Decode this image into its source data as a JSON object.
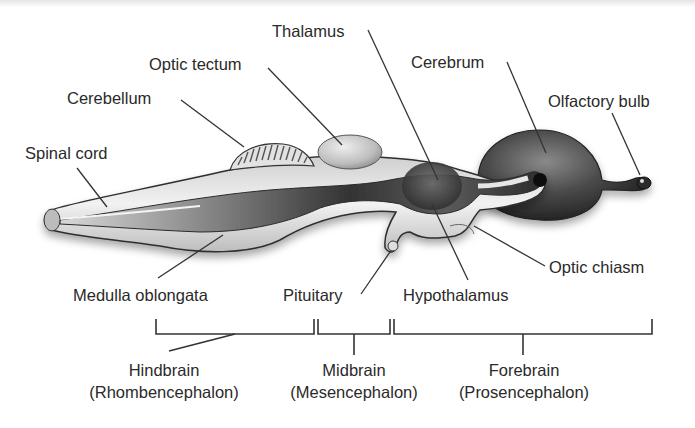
{
  "diagram": {
    "structure_labels": {
      "thalamus": "Thalamus",
      "optic_tectum": "Optic tectum",
      "cerebrum": "Cerebrum",
      "cerebellum": "Cerebellum",
      "olfactory_bulb": "Olfactory bulb",
      "spinal_cord": "Spinal cord",
      "optic_chiasm": "Optic chiasm",
      "medulla_oblongata": "Medulla oblongata",
      "pituitary": "Pituitary",
      "hypothalamus": "Hypothalamus"
    },
    "divisions": [
      {
        "name": "Hindbrain",
        "latin": "(Rhombencephalon)"
      },
      {
        "name": "Midbrain",
        "latin": "(Mesencephalon)"
      },
      {
        "name": "Forebrain",
        "latin": "(Prosencephalon)"
      }
    ],
    "colors": {
      "text": "#2a2a2a",
      "leader_line": "#333333",
      "tissue_light": "#e8e8e8",
      "tissue_dark": "#3a3a3a"
    }
  }
}
